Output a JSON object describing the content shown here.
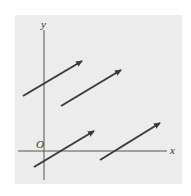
{
  "diagram": {
    "background_color": "#ffffff",
    "panel_color": "#ececec",
    "axis_color": "#555555",
    "arrow_color": "#3a3a3a",
    "labels": {
      "y_axis": "y",
      "x_axis": "x",
      "origin": "O"
    },
    "vectors": [
      {
        "from": [
          23,
          96
        ],
        "to": [
          82,
          61
        ]
      },
      {
        "from": [
          61,
          106
        ],
        "to": [
          121,
          70
        ]
      },
      {
        "from": [
          34,
          167
        ],
        "to": [
          94,
          131
        ]
      },
      {
        "from": [
          100,
          160
        ],
        "to": [
          160,
          123
        ]
      }
    ]
  }
}
